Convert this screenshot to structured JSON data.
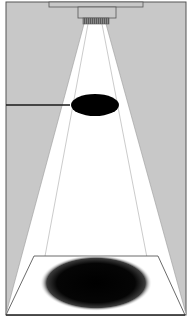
{
  "diagram": {
    "colors": {
      "background": "#c8c8c8",
      "frame": "#555555",
      "light_cone": "#ffffff",
      "disk": "#000000",
      "shadow": "#0a0a0a",
      "lamp_housing": "#c8c8c8",
      "lamp_lens": "#6e6e6e",
      "guide_lines": "#9a9a9a",
      "floor_outline": "#444444"
    },
    "elements": {
      "lamp": {
        "label": "light-source"
      },
      "rod": {
        "label": "disk-support-rod"
      },
      "disk": {
        "label": "opaque-disk"
      },
      "shadow": {
        "label": "cast-shadow"
      },
      "floor": {
        "label": "projection-plane"
      }
    }
  }
}
